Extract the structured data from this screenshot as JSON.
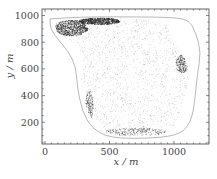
{
  "chart_data": {
    "type": "scatter",
    "title": "",
    "xlabel": "x / m",
    "ylabel": "y / m",
    "xlim": [
      -60,
      1270
    ],
    "ylim": [
      40,
      1050
    ],
    "x_ticks": [
      0,
      500,
      1000
    ],
    "y_ticks": [
      200,
      400,
      600,
      800,
      1000
    ],
    "x_tick_labels": [
      "0",
      "500",
      "1000"
    ],
    "y_tick_labels": [
      "200",
      "400",
      "600",
      "800",
      "1000"
    ],
    "grid": false,
    "legend": null,
    "series": [
      {
        "name": "boundary",
        "kind": "outline",
        "color": "#9a9a9a",
        "points": [
          [
            40,
            975
          ],
          [
            300,
            990
          ],
          [
            700,
            990
          ],
          [
            1020,
            985
          ],
          [
            1120,
            960
          ],
          [
            1170,
            870
          ],
          [
            1210,
            720
          ],
          [
            1180,
            560
          ],
          [
            1160,
            340
          ],
          [
            1130,
            200
          ],
          [
            1050,
            110
          ],
          [
            850,
            80
          ],
          [
            500,
            80
          ],
          [
            360,
            160
          ],
          [
            290,
            280
          ],
          [
            250,
            460
          ],
          [
            240,
            620
          ],
          [
            180,
            730
          ],
          [
            110,
            810
          ],
          [
            40,
            900
          ],
          [
            40,
            975
          ]
        ]
      },
      {
        "name": "particles",
        "kind": "point-cloud",
        "color": "#222222",
        "region": [
          [
            70,
            950
          ],
          [
            300,
            985
          ],
          [
            600,
            985
          ],
          [
            880,
            960
          ],
          [
            980,
            900
          ],
          [
            1000,
            780
          ],
          [
            1080,
            680
          ],
          [
            1120,
            560
          ],
          [
            1090,
            420
          ],
          [
            1060,
            320
          ],
          [
            1000,
            180
          ],
          [
            900,
            110
          ],
          [
            600,
            100
          ],
          [
            420,
            140
          ],
          [
            340,
            260
          ],
          [
            300,
            380
          ],
          [
            280,
            520
          ],
          [
            300,
            640
          ],
          [
            260,
            760
          ],
          [
            170,
            830
          ],
          [
            90,
            880
          ],
          [
            70,
            950
          ]
        ],
        "dense_clusters": [
          {
            "cx": 200,
            "cy": 910,
            "rx": 130,
            "ry": 60,
            "density": "high"
          },
          {
            "cx": 420,
            "cy": 960,
            "rx": 160,
            "ry": 25,
            "density": "high"
          },
          {
            "cx": 1060,
            "cy": 640,
            "rx": 50,
            "ry": 70,
            "density": "medium"
          },
          {
            "cx": 340,
            "cy": 300,
            "rx": 30,
            "ry": 150,
            "density": "medium"
          },
          {
            "cx": 700,
            "cy": 130,
            "rx": 250,
            "ry": 30,
            "density": "medium"
          }
        ]
      }
    ]
  },
  "axes": {
    "x_label": "x / m",
    "y_label": "y / m",
    "x_ticks": [
      "0",
      "500",
      "1000"
    ],
    "y_ticks": [
      "200",
      "400",
      "600",
      "800",
      "1000"
    ]
  }
}
